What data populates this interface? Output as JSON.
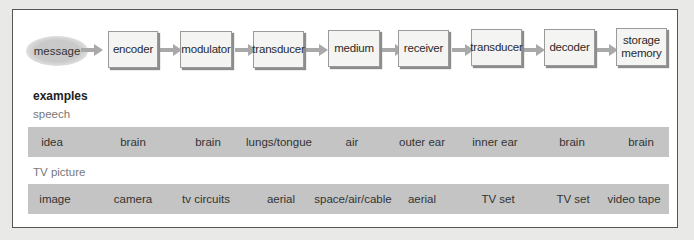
{
  "pipeline": {
    "source": "message",
    "stages": [
      {
        "label": "encoder"
      },
      {
        "label": "modulator"
      },
      {
        "label": "transducer"
      },
      {
        "label": "medium"
      },
      {
        "label": "receiver"
      },
      {
        "label": "transducer"
      },
      {
        "label": "decoder"
      },
      {
        "label": "storage memory",
        "line1": "storage",
        "line2": "memory"
      }
    ],
    "arrow_color": "#a9a9a9"
  },
  "examples": {
    "heading": "examples",
    "rows": [
      {
        "category": "speech",
        "cells": [
          "idea",
          "brain",
          "brain",
          "lungs/tongue",
          "air",
          "outer ear",
          "inner ear",
          "brain",
          "brain"
        ]
      },
      {
        "category": "TV picture",
        "cells": [
          "image",
          "camera",
          "tv circuits",
          "aerial",
          "space/air/cable",
          "aerial",
          "TV set",
          "TV set",
          "video tape"
        ]
      }
    ]
  },
  "colors": {
    "band": "#c4c4c4",
    "node_bg": "#f4f4f2",
    "frame_border": "#555555"
  }
}
